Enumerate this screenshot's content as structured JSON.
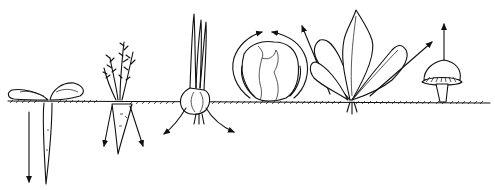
{
  "figure": {
    "colors": {
      "ink": "#111111",
      "background": "#ffffff"
    },
    "plants": [
      {
        "id": "root-seedling",
        "growth": "downward taproot"
      },
      {
        "id": "carrot",
        "growth": "roots spreading downward"
      },
      {
        "id": "onion",
        "growth": "roots spreading sideways"
      },
      {
        "id": "cabbage",
        "growth": "head curling inward"
      },
      {
        "id": "leafy-plant",
        "growth": "leaves outward/upward"
      },
      {
        "id": "mushroom",
        "growth": "upward"
      }
    ]
  }
}
